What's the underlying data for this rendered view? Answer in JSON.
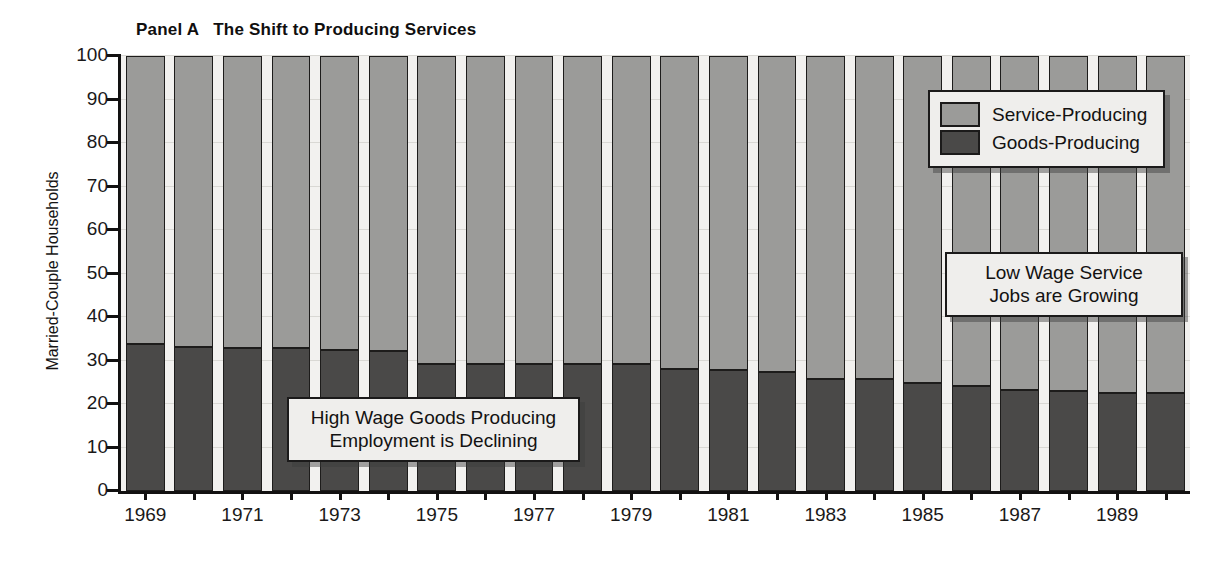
{
  "chart_data": {
    "type": "bar",
    "title": "Panel A   The Shift to Producing Services",
    "panel_label": "Panel A",
    "panel_title": "The Shift to Producing Services",
    "xlabel": "",
    "ylabel": "Married-Couple Households",
    "ylim": [
      0,
      100
    ],
    "ytick_labels": [
      "100",
      "90",
      "80",
      "70",
      "60",
      "50",
      "40",
      "30",
      "20",
      "10",
      "0"
    ],
    "ytick_values": [
      100,
      90,
      80,
      70,
      60,
      50,
      40,
      30,
      20,
      10,
      0
    ],
    "grid": true,
    "legend_position": "top-right",
    "stacked": true,
    "x": [
      1969,
      1970,
      1971,
      1972,
      1973,
      1974,
      1975,
      1976,
      1977,
      1978,
      1979,
      1980,
      1981,
      1982,
      1983,
      1984,
      1985,
      1986,
      1987,
      1988,
      1989,
      1990
    ],
    "xtick_labels": [
      "1969",
      "1971",
      "1973",
      "1975",
      "1977",
      "1979",
      "1981",
      "1983",
      "1985",
      "1987",
      "1989"
    ],
    "xtick_values": [
      1969,
      1971,
      1973,
      1975,
      1977,
      1979,
      1981,
      1983,
      1985,
      1987,
      1989
    ],
    "series": [
      {
        "name": "Goods-Producing",
        "color": "#4a4948",
        "values": [
          33.7,
          33.2,
          32.8,
          32.8,
          32.5,
          32.1,
          29.3,
          29.2,
          29.1,
          29.2,
          29.1,
          28.1,
          27.8,
          27.3,
          25.8,
          25.7,
          24.8,
          24.2,
          23.2,
          23.1,
          22.6,
          22.5
        ]
      },
      {
        "name": "Service-Producing",
        "color": "#9b9b99",
        "values": [
          66.3,
          66.8,
          67.2,
          67.2,
          67.5,
          67.9,
          70.7,
          70.8,
          70.9,
          70.8,
          70.9,
          71.9,
          72.2,
          72.7,
          74.2,
          74.3,
          75.2,
          75.8,
          76.8,
          76.9,
          77.4,
          77.5
        ]
      }
    ],
    "annotations": [
      {
        "id": "goods",
        "line1": "High Wage Goods Producing",
        "line2": "Employment is Declining"
      },
      {
        "id": "service",
        "line1": "Low Wage Service",
        "line2": "Jobs are Growing"
      }
    ]
  },
  "legend": {
    "items": [
      {
        "label": "Service-Producing",
        "color": "#9b9b99"
      },
      {
        "label": "Goods-Producing",
        "color": "#4a4948"
      }
    ]
  },
  "colors": {
    "service": "#9b9b99",
    "goods": "#4a4948",
    "plot_background": "#f2f1ef",
    "axis": "#121111",
    "box_fill": "#efeeec"
  }
}
